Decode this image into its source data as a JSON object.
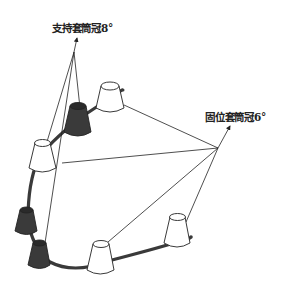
{
  "labels": {
    "support_crown": "支持套筒冠8°",
    "retention_crown": "固位套筒冠6°"
  },
  "colors": {
    "line": "#222222",
    "dark_crown": "#3a3a3a",
    "white_crown": "#ffffff",
    "bar": "#3a3a3a"
  },
  "crowns": [
    {
      "id": "white-top",
      "type": "retention"
    },
    {
      "id": "dark-upper",
      "type": "support"
    },
    {
      "id": "white-left",
      "type": "retention"
    },
    {
      "id": "dark-left",
      "type": "support"
    },
    {
      "id": "dark-bottom",
      "type": "support"
    },
    {
      "id": "white-bottom",
      "type": "retention"
    },
    {
      "id": "white-right",
      "type": "retention"
    }
  ]
}
